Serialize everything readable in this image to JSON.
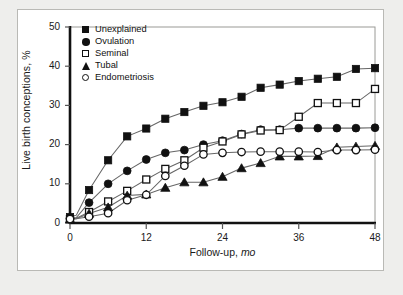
{
  "figure": {
    "background_color": "#eeeeec",
    "panel_color": "#ffffff",
    "border_color": "#b9b9b5"
  },
  "legend": {
    "position": "top-left-inside",
    "entries": [
      {
        "label": "Unexplained",
        "marker": "filled-square",
        "marker_name": "filled-square-marker-icon"
      },
      {
        "label": "Ovulation",
        "marker": "filled-circle",
        "marker_name": "filled-circle-marker-icon"
      },
      {
        "label": "Seminal",
        "marker": "open-square",
        "marker_name": "open-square-marker-icon"
      },
      {
        "label": "Tubal",
        "marker": "filled-triangle",
        "marker_name": "filled-triangle-marker-icon"
      },
      {
        "label": "Endometriosis",
        "marker": "open-circle",
        "marker_name": "open-circle-marker-icon"
      }
    ]
  },
  "chart_data": {
    "type": "line",
    "title": "",
    "subtitle": "",
    "xlabel": "Follow-up, mo",
    "xlabel_plain": "Follow-up,",
    "xlabel_italic": "mo",
    "ylabel": "Live birth conceptions, %",
    "xlim": [
      0,
      48
    ],
    "ylim": [
      0,
      50
    ],
    "xticks": [
      0,
      12,
      24,
      36,
      48
    ],
    "xtick_labels": [
      "0",
      "12",
      "24",
      "36",
      "48"
    ],
    "yticks": [
      0,
      10,
      20,
      30,
      40,
      50
    ],
    "ytick_labels": [
      "0",
      "10",
      "20",
      "30",
      "40",
      "50"
    ],
    "grid": false,
    "legend_position": "upper left",
    "line_color": "#555555",
    "marker_color": "#111111",
    "x": [
      0,
      1,
      3,
      6,
      9,
      12,
      15,
      18,
      21,
      24,
      27,
      30,
      33,
      36,
      39,
      42,
      45,
      48
    ],
    "series": [
      {
        "name": "Unexplained",
        "marker": "filled-square",
        "values": [
          1.5,
          2.0,
          8.4,
          16.0,
          22.1,
          24.1,
          26.6,
          28.3,
          29.9,
          30.8,
          32.2,
          34.5,
          35.3,
          36.2,
          36.8,
          37.3,
          39.3,
          39.5
        ]
      },
      {
        "name": "Ovulation",
        "marker": "filled-circle",
        "values": [
          1.2,
          1.4,
          5.2,
          10.0,
          13.3,
          16.2,
          17.9,
          18.6,
          20.0,
          21.0,
          22.7,
          23.8,
          23.8,
          24.2,
          24.2,
          24.2,
          24.2,
          24.3
        ]
      },
      {
        "name": "Seminal",
        "marker": "open-square",
        "values": [
          1.0,
          1.2,
          2.8,
          5.5,
          8.2,
          11.1,
          13.8,
          16.0,
          19.2,
          20.8,
          22.6,
          23.6,
          23.7,
          27.1,
          30.6,
          30.6,
          30.6,
          34.2
        ]
      },
      {
        "name": "Tubal",
        "marker": "filled-triangle",
        "values": [
          1.0,
          1.1,
          2.4,
          4.0,
          7.0,
          7.3,
          9.0,
          10.4,
          10.4,
          11.8,
          14.0,
          15.3,
          17.0,
          17.0,
          17.1,
          19.3,
          19.5,
          19.7
        ]
      },
      {
        "name": "Endometriosis",
        "marker": "open-circle",
        "values": [
          1.0,
          1.1,
          1.6,
          2.5,
          5.8,
          7.2,
          12.0,
          14.6,
          17.5,
          17.9,
          18.1,
          18.2,
          18.2,
          18.2,
          18.1,
          18.6,
          18.6,
          18.7
        ]
      }
    ]
  }
}
